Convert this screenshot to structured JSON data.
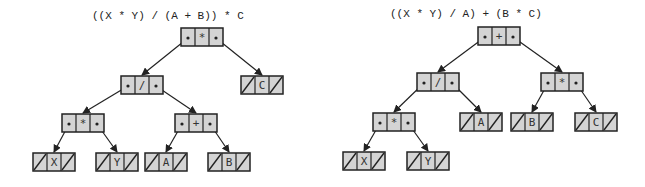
{
  "diagram": {
    "colors": {
      "node_fill": "#d4d4d4",
      "stroke": "#222222",
      "background": "#ffffff"
    },
    "trees": [
      {
        "expression": "((X * Y) / (A + B)) * C",
        "expr_pos": [
          92,
          20
        ],
        "nodes": [
          {
            "id": "root",
            "label": "*",
            "x": 181,
            "y": 28,
            "leaf": false
          },
          {
            "id": "div",
            "label": "/",
            "x": 121,
            "y": 76,
            "leaf": false
          },
          {
            "id": "C",
            "label": "C",
            "x": 241,
            "y": 76,
            "leaf": true
          },
          {
            "id": "mul",
            "label": "*",
            "x": 62,
            "y": 114,
            "leaf": false
          },
          {
            "id": "plus",
            "label": "+",
            "x": 175,
            "y": 114,
            "leaf": false
          },
          {
            "id": "X",
            "label": "X",
            "x": 33,
            "y": 153,
            "leaf": true
          },
          {
            "id": "Y",
            "label": "Y",
            "x": 96,
            "y": 153,
            "leaf": true
          },
          {
            "id": "A",
            "label": "A",
            "x": 145,
            "y": 153,
            "leaf": true
          },
          {
            "id": "B",
            "label": "B",
            "x": 208,
            "y": 153,
            "leaf": true
          }
        ],
        "edges": [
          [
            "root",
            "div",
            "L"
          ],
          [
            "root",
            "C",
            "R"
          ],
          [
            "div",
            "mul",
            "L"
          ],
          [
            "div",
            "plus",
            "R"
          ],
          [
            "mul",
            "X",
            "L"
          ],
          [
            "mul",
            "Y",
            "R"
          ],
          [
            "plus",
            "A",
            "L"
          ],
          [
            "plus",
            "B",
            "R"
          ]
        ]
      },
      {
        "expression": "((X * Y) / A) + (B * C)",
        "expr_pos": [
          390,
          18
        ],
        "nodes": [
          {
            "id": "root",
            "label": "+",
            "x": 478,
            "y": 27,
            "leaf": false
          },
          {
            "id": "div",
            "label": "/",
            "x": 417,
            "y": 73,
            "leaf": false
          },
          {
            "id": "mul2",
            "label": "*",
            "x": 541,
            "y": 73,
            "leaf": false
          },
          {
            "id": "mul",
            "label": "*",
            "x": 373,
            "y": 113,
            "leaf": false
          },
          {
            "id": "A",
            "label": "A",
            "x": 460,
            "y": 113,
            "leaf": true
          },
          {
            "id": "B",
            "label": "B",
            "x": 511,
            "y": 113,
            "leaf": true
          },
          {
            "id": "C",
            "label": "C",
            "x": 575,
            "y": 113,
            "leaf": true
          },
          {
            "id": "X",
            "label": "X",
            "x": 343,
            "y": 152,
            "leaf": true
          },
          {
            "id": "Y",
            "label": "Y",
            "x": 407,
            "y": 152,
            "leaf": true
          }
        ],
        "edges": [
          [
            "root",
            "div",
            "L"
          ],
          [
            "root",
            "mul2",
            "R"
          ],
          [
            "div",
            "mul",
            "L"
          ],
          [
            "div",
            "A",
            "R"
          ],
          [
            "mul2",
            "B",
            "L"
          ],
          [
            "mul2",
            "C",
            "R"
          ],
          [
            "mul",
            "X",
            "L"
          ],
          [
            "mul",
            "Y",
            "R"
          ]
        ]
      }
    ]
  }
}
